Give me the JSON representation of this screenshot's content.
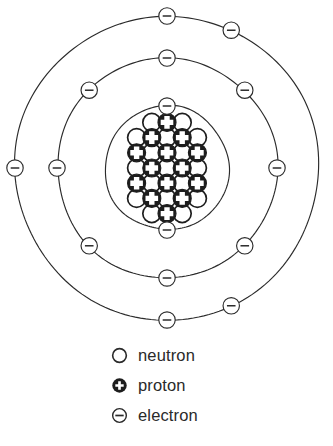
{
  "figure": {
    "center": {
      "x": 167,
      "y": 168
    },
    "nucleus": {
      "cell": 15.2,
      "radius": 9.0,
      "grid": [
        {
          "row": 0,
          "items": [
            {
              "col": 1,
              "type": "neutron"
            },
            {
              "col": 2,
              "type": "proton"
            },
            {
              "col": 3,
              "type": "neutron"
            }
          ]
        },
        {
          "row": 1,
          "items": [
            {
              "col": 0,
              "type": "neutron"
            },
            {
              "col": 1,
              "type": "proton"
            },
            {
              "col": 2,
              "type": "neutron"
            },
            {
              "col": 3,
              "type": "proton"
            },
            {
              "col": 4,
              "type": "neutron"
            }
          ]
        },
        {
          "row": 2,
          "items": [
            {
              "col": 0,
              "type": "proton"
            },
            {
              "col": 1,
              "type": "neutron"
            },
            {
              "col": 2,
              "type": "proton"
            },
            {
              "col": 3,
              "type": "neutron"
            },
            {
              "col": 4,
              "type": "proton"
            }
          ]
        },
        {
          "row": 3,
          "items": [
            {
              "col": 0,
              "type": "neutron"
            },
            {
              "col": 1,
              "type": "proton"
            },
            {
              "col": 2,
              "type": "neutron"
            },
            {
              "col": 3,
              "type": "proton"
            },
            {
              "col": 4,
              "type": "neutron"
            }
          ]
        },
        {
          "row": 4,
          "items": [
            {
              "col": 0,
              "type": "proton"
            },
            {
              "col": 1,
              "type": "neutron"
            },
            {
              "col": 2,
              "type": "proton"
            },
            {
              "col": 3,
              "type": "neutron"
            },
            {
              "col": 4,
              "type": "proton"
            }
          ]
        },
        {
          "row": 5,
          "items": [
            {
              "col": 0,
              "type": "neutron"
            },
            {
              "col": 1,
              "type": "proton"
            },
            {
              "col": 2,
              "type": "neutron"
            },
            {
              "col": 3,
              "type": "proton"
            },
            {
              "col": 4,
              "type": "neutron"
            }
          ]
        },
        {
          "row": 6,
          "items": [
            {
              "col": 1,
              "type": "neutron"
            },
            {
              "col": 2,
              "type": "proton"
            },
            {
              "col": 3,
              "type": "neutron"
            }
          ]
        }
      ]
    },
    "shells": [
      {
        "name": "inner-shell",
        "radius": 62,
        "electron_count": 2,
        "electron_angles": [
          0,
          180
        ]
      },
      {
        "name": "middle-shell",
        "radius": 110,
        "electron_count": 8,
        "electron_angles": [
          0,
          45,
          90,
          135,
          180,
          225,
          270,
          315
        ]
      },
      {
        "name": "outer-shell",
        "radius": 152,
        "electron_count": 5,
        "electron_angles": [
          0,
          25,
          155,
          180,
          270
        ]
      }
    ],
    "electron_marker": {
      "radius": 8.2,
      "bar_half_width": 4.3
    }
  },
  "legend": {
    "items": [
      {
        "glyph": "open-circle-icon",
        "label": "neutron"
      },
      {
        "glyph": "filled-circle-plus-icon",
        "label": "proton"
      },
      {
        "glyph": "circle-minus-icon",
        "label": "electron"
      }
    ]
  },
  "colors": {
    "ink": "#2b2b2b",
    "nucleus_ink": "#1d1d1d",
    "paper": "#ffffff"
  }
}
